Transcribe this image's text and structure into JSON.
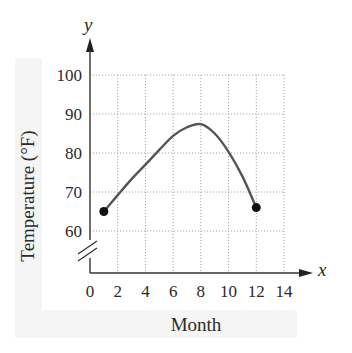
{
  "chart_data": {
    "type": "line",
    "title": "",
    "xlabel": "Month",
    "ylabel": "Temperature (°F)",
    "x_axis_name": "x",
    "y_axis_name": "y",
    "xlim": [
      0,
      14
    ],
    "ylim": [
      60,
      100
    ],
    "x_ticks": [
      "0",
      "2",
      "4",
      "6",
      "8",
      "10",
      "12",
      "14"
    ],
    "y_ticks": [
      "60",
      "70",
      "80",
      "90",
      "100"
    ],
    "grid": true,
    "y_axis_break": true,
    "series": [
      {
        "name": "Temperature",
        "x": [
          1,
          2,
          3,
          4,
          5,
          6,
          7,
          8,
          9,
          10,
          11,
          12
        ],
        "values": [
          65,
          69.2,
          73.3,
          77,
          80.8,
          84.4,
          86.6,
          87.4,
          85,
          80.3,
          74,
          66
        ],
        "endpoints": [
          [
            1,
            65
          ],
          [
            12,
            66
          ]
        ],
        "color": "#555555"
      }
    ]
  }
}
